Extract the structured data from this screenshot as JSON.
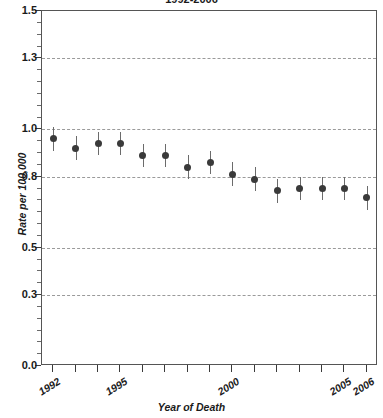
{
  "chart_data": {
    "type": "scatter",
    "title": "1992-2006",
    "xlabel": "Year of Death",
    "ylabel": "Rate per 100,000",
    "xlim": [
      1991.5,
      2006.5
    ],
    "ylim": [
      0.0,
      1.5
    ],
    "grid": "horizontal-dashed",
    "legend": "none",
    "error_bars": "vertical-95ci",
    "ytick_labels": [
      "0.0",
      "0.3",
      "0.5",
      "0.8",
      "1.0",
      "1.3",
      "1.5"
    ],
    "ytick_values": [
      0.0,
      0.3,
      0.5,
      0.8,
      1.0,
      1.3,
      1.5
    ],
    "gridline_values": [
      0.3,
      0.5,
      0.8,
      1.0,
      1.3
    ],
    "xtick_values": [
      1992,
      1993,
      1994,
      1995,
      1996,
      1997,
      1998,
      1999,
      2000,
      2001,
      2002,
      2003,
      2004,
      2005,
      2006
    ],
    "xtick_labels": [
      "1992",
      "",
      "",
      "1995",
      "",
      "",
      "",
      "",
      "2000",
      "",
      "",
      "",
      "",
      "2005",
      "2006"
    ],
    "categories": [
      1992,
      1993,
      1994,
      1995,
      1996,
      1997,
      1998,
      1999,
      2000,
      2001,
      2002,
      2003,
      2004,
      2005,
      2006
    ],
    "values": [
      0.96,
      0.92,
      0.94,
      0.94,
      0.89,
      0.89,
      0.84,
      0.86,
      0.81,
      0.79,
      0.74,
      0.75,
      0.75,
      0.75,
      0.71
    ],
    "lower": [
      0.91,
      0.87,
      0.89,
      0.89,
      0.84,
      0.84,
      0.79,
      0.81,
      0.76,
      0.74,
      0.69,
      0.7,
      0.7,
      0.7,
      0.66
    ],
    "upper": [
      1.01,
      0.97,
      0.99,
      0.99,
      0.94,
      0.94,
      0.89,
      0.91,
      0.86,
      0.84,
      0.79,
      0.8,
      0.8,
      0.8,
      0.76
    ],
    "series": [
      {
        "name": "Rate per 100,000",
        "values": [
          0.96,
          0.92,
          0.94,
          0.94,
          0.89,
          0.89,
          0.84,
          0.86,
          0.81,
          0.79,
          0.74,
          0.75,
          0.75,
          0.75,
          0.71
        ]
      }
    ],
    "colors": {
      "marker": "#3a3a3a",
      "errorbar": "#6b6b6b",
      "grid": "#9a9a9a",
      "frame": "#555555",
      "text": "#1a1a1a"
    }
  }
}
